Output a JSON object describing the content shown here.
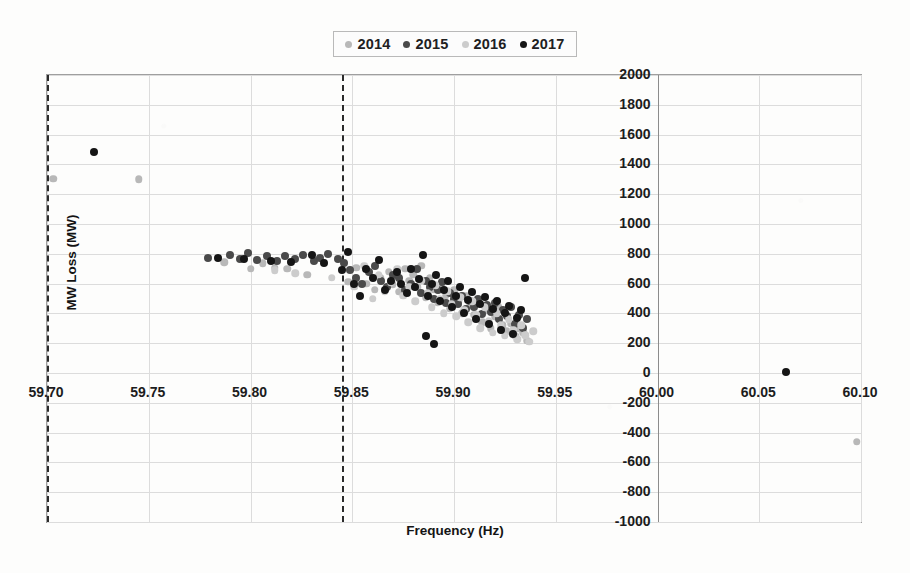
{
  "chart_data": {
    "type": "scatter",
    "title": "",
    "xlabel": "Frequency (Hz)",
    "ylabel": "MW Loss (MW)",
    "xlim": [
      59.7,
      60.1
    ],
    "ylim": [
      -1000,
      2000
    ],
    "xticks": [
      "59.70",
      "59.75",
      "59.80",
      "59.85",
      "59.90",
      "59.95",
      "60.00",
      "60.05",
      "60.10"
    ],
    "xtick_values": [
      59.7,
      59.75,
      59.8,
      59.85,
      59.9,
      59.95,
      60.0,
      60.05,
      60.1
    ],
    "yticks": [
      "2000",
      "1800",
      "1600",
      "1400",
      "1200",
      "1000",
      "800",
      "600",
      "400",
      "200",
      "0",
      "-200",
      "-400",
      "-600",
      "-800",
      "-1000"
    ],
    "ytick_values": [
      2000,
      1800,
      1600,
      1400,
      1200,
      1000,
      800,
      600,
      400,
      200,
      0,
      -200,
      -400,
      -600,
      -800,
      -1000
    ],
    "grid": true,
    "legend_position": "top-center",
    "value_axis_crosses_at_x": 60.0,
    "reference_lines": [
      {
        "name": "dashed-line-left",
        "orientation": "vertical",
        "x": 59.7,
        "style": "dashed",
        "color": "#2b2b2b"
      },
      {
        "name": "dashed-line-right",
        "orientation": "vertical",
        "x": 59.845,
        "style": "dashed",
        "color": "#2b2b2b"
      }
    ],
    "colors": {
      "2014": "#b8b8b8",
      "2015": "#4a4a4a",
      "2016": "#cccccc",
      "2017": "#151515"
    },
    "series": [
      {
        "name": "2014",
        "color": "#b8b8b8",
        "points": [
          [
            59.703,
            1305
          ],
          [
            59.745,
            1300
          ],
          [
            59.787,
            742
          ],
          [
            59.8,
            700
          ],
          [
            59.806,
            735
          ],
          [
            59.812,
            706
          ],
          [
            59.818,
            700
          ],
          [
            59.828,
            660
          ],
          [
            59.848,
            612
          ],
          [
            59.852,
            705
          ],
          [
            59.857,
            600
          ],
          [
            59.861,
            560
          ],
          [
            59.864,
            640
          ],
          [
            59.868,
            680
          ],
          [
            59.87,
            596
          ],
          [
            59.873,
            545
          ],
          [
            59.876,
            700
          ],
          [
            59.878,
            620
          ],
          [
            59.88,
            660
          ],
          [
            59.882,
            575
          ],
          [
            59.884,
            720
          ],
          [
            59.886,
            508
          ],
          [
            59.888,
            640
          ],
          [
            59.89,
            560
          ],
          [
            59.892,
            470
          ],
          [
            59.894,
            600
          ],
          [
            59.896,
            520
          ],
          [
            59.898,
            430
          ],
          [
            59.9,
            560
          ],
          [
            59.902,
            480
          ],
          [
            59.904,
            400
          ],
          [
            59.906,
            520
          ],
          [
            59.908,
            450
          ],
          [
            59.91,
            390
          ],
          [
            59.912,
            470
          ],
          [
            59.914,
            340
          ],
          [
            59.916,
            420
          ],
          [
            59.918,
            300
          ],
          [
            59.92,
            380
          ],
          [
            59.922,
            440
          ],
          [
            59.924,
            320
          ],
          [
            59.926,
            280
          ],
          [
            59.928,
            330
          ],
          [
            59.93,
            250
          ],
          [
            59.932,
            300
          ],
          [
            59.934,
            270
          ],
          [
            59.936,
            215
          ],
          [
            60.098,
            -460
          ]
        ]
      },
      {
        "name": "2015",
        "color": "#4a4a4a",
        "points": [
          [
            59.779,
            772
          ],
          [
            59.79,
            790
          ],
          [
            59.795,
            768
          ],
          [
            59.799,
            805
          ],
          [
            59.803,
            760
          ],
          [
            59.808,
            782
          ],
          [
            59.813,
            750
          ],
          [
            59.817,
            788
          ],
          [
            59.822,
            763
          ],
          [
            59.826,
            790
          ],
          [
            59.831,
            752
          ],
          [
            59.834,
            775
          ],
          [
            59.838,
            800
          ],
          [
            59.843,
            765
          ],
          [
            59.846,
            740
          ],
          [
            59.849,
            690
          ],
          [
            59.852,
            640
          ],
          [
            59.855,
            600
          ],
          [
            59.858,
            676
          ],
          [
            59.861,
            720
          ],
          [
            59.864,
            618
          ],
          [
            59.867,
            580
          ],
          [
            59.87,
            660
          ],
          [
            59.873,
            640
          ],
          [
            59.876,
            560
          ],
          [
            59.879,
            600
          ],
          [
            59.882,
            700
          ],
          [
            59.884,
            540
          ],
          [
            59.886,
            620
          ],
          [
            59.888,
            580
          ],
          [
            59.89,
            500
          ],
          [
            59.892,
            560
          ],
          [
            59.894,
            610
          ],
          [
            59.896,
            470
          ],
          [
            59.898,
            540
          ],
          [
            59.9,
            500
          ],
          [
            59.902,
            460
          ],
          [
            59.904,
            520
          ],
          [
            59.906,
            430
          ],
          [
            59.908,
            480
          ],
          [
            59.91,
            440
          ],
          [
            59.912,
            500
          ],
          [
            59.914,
            395
          ],
          [
            59.916,
            455
          ],
          [
            59.918,
            410
          ],
          [
            59.92,
            470
          ],
          [
            59.922,
            360
          ],
          [
            59.924,
            420
          ],
          [
            59.926,
            380
          ],
          [
            59.928,
            440
          ],
          [
            59.93,
            330
          ],
          [
            59.932,
            390
          ],
          [
            59.934,
            300
          ],
          [
            59.936,
            360
          ]
        ]
      },
      {
        "name": "2016",
        "color": "#cccccc",
        "points": [
          [
            59.812,
            690
          ],
          [
            59.822,
            668
          ],
          [
            59.84,
            640
          ],
          [
            59.851,
            580
          ],
          [
            59.856,
            720
          ],
          [
            59.86,
            500
          ],
          [
            59.863,
            660
          ],
          [
            59.866,
            548
          ],
          [
            59.869,
            610
          ],
          [
            59.872,
            700
          ],
          [
            59.875,
            520
          ],
          [
            59.878,
            580
          ],
          [
            59.881,
            480
          ],
          [
            59.884,
            620
          ],
          [
            59.887,
            540
          ],
          [
            59.889,
            440
          ],
          [
            59.891,
            590
          ],
          [
            59.893,
            500
          ],
          [
            59.895,
            400
          ],
          [
            59.897,
            550
          ],
          [
            59.899,
            460
          ],
          [
            59.901,
            380
          ],
          [
            59.903,
            510
          ],
          [
            59.905,
            420
          ],
          [
            59.907,
            340
          ],
          [
            59.909,
            480
          ],
          [
            59.911,
            390
          ],
          [
            59.913,
            300
          ],
          [
            59.915,
            440
          ],
          [
            59.917,
            350
          ],
          [
            59.919,
            270
          ],
          [
            59.921,
            400
          ],
          [
            59.923,
            320
          ],
          [
            59.925,
            250
          ],
          [
            59.927,
            360
          ],
          [
            59.929,
            290
          ],
          [
            59.931,
            225
          ],
          [
            59.933,
            320
          ],
          [
            59.935,
            255
          ],
          [
            59.937,
            210
          ],
          [
            59.939,
            280
          ]
        ]
      },
      {
        "name": "2017",
        "color": "#151515",
        "points": [
          [
            59.723,
            1480
          ],
          [
            59.784,
            770
          ],
          [
            59.797,
            762
          ],
          [
            59.81,
            755
          ],
          [
            59.82,
            745
          ],
          [
            59.83,
            790
          ],
          [
            59.836,
            735
          ],
          [
            59.845,
            690
          ],
          [
            59.848,
            810
          ],
          [
            59.851,
            600
          ],
          [
            59.854,
            520
          ],
          [
            59.857,
            700
          ],
          [
            59.86,
            640
          ],
          [
            59.863,
            760
          ],
          [
            59.866,
            560
          ],
          [
            59.869,
            620
          ],
          [
            59.872,
            680
          ],
          [
            59.874,
            600
          ],
          [
            59.877,
            540
          ],
          [
            59.879,
            700
          ],
          [
            59.881,
            580
          ],
          [
            59.883,
            630
          ],
          [
            59.885,
            790
          ],
          [
            59.887,
            520
          ],
          [
            59.889,
            600
          ],
          [
            59.891,
            660
          ],
          [
            59.893,
            480
          ],
          [
            59.895,
            560
          ],
          [
            59.897,
            620
          ],
          [
            59.899,
            440
          ],
          [
            59.901,
            520
          ],
          [
            59.903,
            580
          ],
          [
            59.905,
            400
          ],
          [
            59.907,
            490
          ],
          [
            59.909,
            545
          ],
          [
            59.911,
            360
          ],
          [
            59.913,
            460
          ],
          [
            59.915,
            510
          ],
          [
            59.917,
            330
          ],
          [
            59.919,
            430
          ],
          [
            59.921,
            480
          ],
          [
            59.923,
            290
          ],
          [
            59.925,
            400
          ],
          [
            59.927,
            450
          ],
          [
            59.929,
            260
          ],
          [
            59.931,
            370
          ],
          [
            59.933,
            420
          ],
          [
            59.935,
            640
          ],
          [
            59.89,
            195
          ],
          [
            59.886,
            245
          ],
          [
            60.063,
            10
          ]
        ]
      }
    ]
  },
  "legend": {
    "items": [
      {
        "label": "2014",
        "color": "#b8b8b8"
      },
      {
        "label": "2015",
        "color": "#4a4a4a"
      },
      {
        "label": "2016",
        "color": "#cccccc"
      },
      {
        "label": "2017",
        "color": "#151515"
      }
    ]
  }
}
